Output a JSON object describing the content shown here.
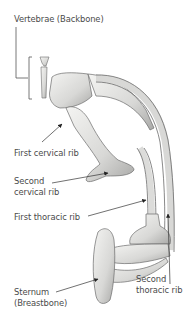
{
  "diagram": {
    "labels": {
      "vertebrae": "Vertebrae (Backbone)",
      "first_cervical_rib": "First cervical rib",
      "second_cervical_rib_line1": "Second",
      "second_cervical_rib_line2": "cervical rib",
      "first_thoracic_rib": "First thoracic rib",
      "second_thoracic_rib_line1": "Second",
      "second_thoracic_rib_line2": "thoracic rib",
      "sternum_line1": "Sternum",
      "sternum_line2": "(Breastbone)"
    },
    "colors": {
      "text": "#4a4a4a",
      "leader_line": "#333333",
      "bone_fill": "#e9e9e7",
      "bone_shade": "#a8a8a6",
      "bone_outline": "#6b6b6b"
    }
  }
}
